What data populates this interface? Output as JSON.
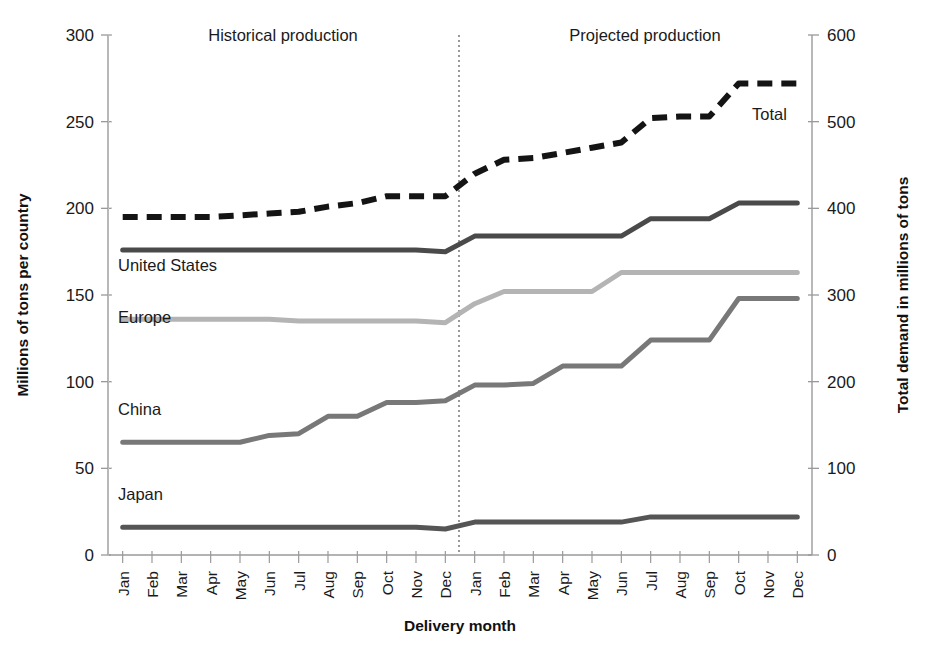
{
  "chart_data": {
    "type": "line",
    "title": "",
    "xlabel": "Delivery month",
    "ylabel": "Millions of tons per country",
    "y2label": "Total demand in millions of tons",
    "ylim": [
      0,
      300
    ],
    "y2lim": [
      0,
      600
    ],
    "yticks": [
      "0",
      "50",
      "100",
      "150",
      "200",
      "250",
      "300"
    ],
    "ytick_values": [
      0,
      50,
      100,
      150,
      200,
      250,
      300
    ],
    "y2ticks": [
      "0",
      "100",
      "200",
      "300",
      "400",
      "500",
      "600"
    ],
    "y2tick_values": [
      0,
      100,
      200,
      300,
      400,
      500,
      600
    ],
    "grid": false,
    "legend_position": "inline-labels",
    "x": [
      "Jan",
      "Feb",
      "Mar",
      "Apr",
      "May",
      "Jun",
      "Jul",
      "Aug",
      "Sep",
      "Oct",
      "Nov",
      "Dec",
      "Jan",
      "Feb",
      "Mar",
      "Apr",
      "May",
      "Jun",
      "Jul",
      "Aug",
      "Sep",
      "Oct",
      "Nov",
      "Dec"
    ],
    "categories": [
      "Jan",
      "Feb",
      "Mar",
      "Apr",
      "May",
      "Jun",
      "Jul",
      "Aug",
      "Sep",
      "Oct",
      "Nov",
      "Dec",
      "Jan",
      "Feb",
      "Mar",
      "Apr",
      "May",
      "Jun",
      "Jul",
      "Aug",
      "Sep",
      "Oct",
      "Nov",
      "Dec"
    ],
    "region_divider_after_index": 11,
    "annotations": [
      {
        "text": "Historical production",
        "x_index": 5,
        "position": "top-left"
      },
      {
        "text": "Projected production",
        "x_index": 17,
        "position": "top-right"
      },
      {
        "text": "Total",
        "x_index": 21,
        "position": "on-series-total"
      },
      {
        "text": "United States",
        "x_index": 0,
        "position": "below-series"
      },
      {
        "text": "Europe",
        "x_index": 0,
        "position": "below-series"
      },
      {
        "text": "China",
        "x_index": 0,
        "position": "above-series"
      },
      {
        "text": "Japan",
        "x_index": 0,
        "position": "above-series"
      }
    ],
    "series": [
      {
        "name": "Total",
        "axis": "right",
        "style": "dashed",
        "color": "#141414",
        "label": "Total",
        "values_left_scale": [
          195,
          195,
          195,
          195,
          196,
          197,
          198,
          201,
          203,
          207,
          207,
          207,
          220,
          228,
          229,
          232,
          235,
          238,
          252,
          253,
          253,
          272,
          272,
          272
        ],
        "values": [
          390,
          390,
          390,
          390,
          392,
          394,
          396,
          402,
          406,
          414,
          414,
          414,
          440,
          456,
          458,
          464,
          470,
          476,
          504,
          506,
          506,
          544,
          544,
          544
        ]
      },
      {
        "name": "United States",
        "axis": "left",
        "style": "solid",
        "color": "#4a4a4a",
        "label": "United States",
        "values": [
          176,
          176,
          176,
          176,
          176,
          176,
          176,
          176,
          176,
          176,
          176,
          175,
          184,
          184,
          184,
          184,
          184,
          184,
          194,
          194,
          194,
          203,
          203,
          203
        ]
      },
      {
        "name": "Europe",
        "axis": "left",
        "style": "solid",
        "color": "#b4b4b4",
        "label": "Europe",
        "values": [
          136,
          136,
          136,
          136,
          136,
          136,
          135,
          135,
          135,
          135,
          135,
          134,
          145,
          152,
          152,
          152,
          152,
          163,
          163,
          163,
          163,
          163,
          163,
          163
        ]
      },
      {
        "name": "China",
        "axis": "left",
        "style": "solid",
        "color": "#787878",
        "label": "China",
        "values": [
          65,
          65,
          65,
          65,
          65,
          69,
          70,
          80,
          80,
          88,
          88,
          89,
          98,
          98,
          99,
          109,
          109,
          109,
          124,
          124,
          124,
          148,
          148,
          148
        ]
      },
      {
        "name": "Japan",
        "axis": "left",
        "style": "solid",
        "color": "#555555",
        "label": "Japan",
        "values": [
          16,
          16,
          16,
          16,
          16,
          16,
          16,
          16,
          16,
          16,
          16,
          15,
          19,
          19,
          19,
          19,
          19,
          19,
          22,
          22,
          22,
          22,
          22,
          22
        ]
      }
    ]
  },
  "labels": {
    "historical": "Historical production",
    "projected": "Projected production",
    "total": "Total",
    "united_states": "United States",
    "europe": "Europe",
    "china": "China",
    "japan": "Japan",
    "y_axis_title": "Millions of tons per country",
    "y2_axis_title": "Total demand in millions of tons",
    "x_axis_title": "Delivery month"
  }
}
